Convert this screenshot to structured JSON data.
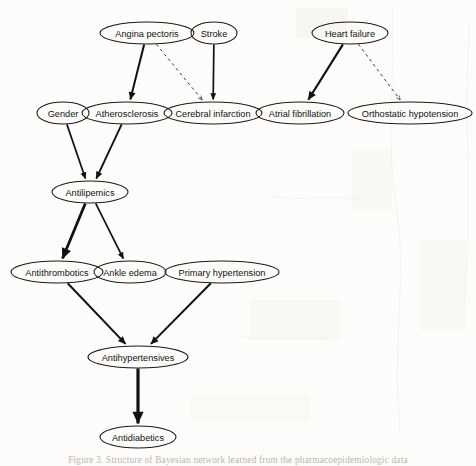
{
  "figure": {
    "type": "directed-acyclic-graph",
    "background_color": "#fdfcfa",
    "node_stroke_color": "#1a1a1a",
    "edge_solid_color": "#111111",
    "edge_dashed_color": "#3a3a3a",
    "caption": "Figure 3. Structure of Bayesian network learned from the pharmacoepidemiologic data"
  },
  "graph": {
    "nodes": [
      {
        "id": "angina_pectoris",
        "label": "Angina pectoris",
        "cx": 147,
        "cy": 33,
        "rx": 47,
        "ry": 11,
        "row": 1
      },
      {
        "id": "stroke",
        "label": "Stroke",
        "cx": 214,
        "cy": 33,
        "rx": 23,
        "ry": 11,
        "row": 1
      },
      {
        "id": "heart_failure",
        "label": "Heart failure",
        "cx": 350,
        "cy": 33,
        "rx": 38,
        "ry": 11,
        "row": 1
      },
      {
        "id": "gender",
        "label": "Gender",
        "cx": 63,
        "cy": 113,
        "rx": 26,
        "ry": 11,
        "row": 2
      },
      {
        "id": "atherosclerosis",
        "label": "Atherosclerosis",
        "cx": 127,
        "cy": 113,
        "rx": 45,
        "ry": 11,
        "row": 2
      },
      {
        "id": "cerebral_infarction",
        "label": "Cerebral infarction",
        "cx": 213,
        "cy": 113,
        "rx": 49,
        "ry": 11,
        "row": 2
      },
      {
        "id": "atrial_fibrillation",
        "label": "Atrial fibrillation",
        "cx": 300,
        "cy": 113,
        "rx": 44,
        "ry": 11,
        "row": 2
      },
      {
        "id": "orthostatic_hypotension",
        "label": "Orthostatic hypotension",
        "cx": 410,
        "cy": 113,
        "rx": 62,
        "ry": 11,
        "row": 2
      },
      {
        "id": "antilipemics",
        "label": "Antilipemics",
        "cx": 90,
        "cy": 192,
        "rx": 38,
        "ry": 11,
        "row": 3
      },
      {
        "id": "antithrombotics",
        "label": "Antithrombotics",
        "cx": 57,
        "cy": 272,
        "rx": 46,
        "ry": 11,
        "row": 4
      },
      {
        "id": "ankle_edema",
        "label": "Ankle edema",
        "cx": 130,
        "cy": 272,
        "rx": 36,
        "ry": 11,
        "row": 4
      },
      {
        "id": "primary_hypertension",
        "label": "Primary hypertension",
        "cx": 222,
        "cy": 272,
        "rx": 57,
        "ry": 11,
        "row": 4
      },
      {
        "id": "antihypertensives",
        "label": "Antihypertensives",
        "cx": 138,
        "cy": 357,
        "rx": 50,
        "ry": 11,
        "row": 5
      },
      {
        "id": "antidiabetics",
        "label": "Antidiabetics",
        "cx": 138,
        "cy": 437,
        "rx": 38,
        "ry": 11,
        "row": 6
      }
    ],
    "edges": [
      {
        "id": "e1",
        "from": "angina_pectoris",
        "to": "atherosclerosis",
        "style": "solid",
        "width": 2.0
      },
      {
        "id": "e2",
        "from": "angina_pectoris",
        "to": "cerebral_infarction",
        "style": "dashed",
        "width": 1.0
      },
      {
        "id": "e3",
        "from": "stroke",
        "to": "cerebral_infarction",
        "style": "solid",
        "width": 1.7
      },
      {
        "id": "e4",
        "from": "heart_failure",
        "to": "atrial_fibrillation",
        "style": "solid",
        "width": 2.2
      },
      {
        "id": "e5",
        "from": "heart_failure",
        "to": "orthostatic_hypotension",
        "style": "dashed",
        "width": 1.0
      },
      {
        "id": "e6",
        "from": "gender",
        "to": "antilipemics",
        "style": "solid",
        "width": 1.7
      },
      {
        "id": "e7",
        "from": "atherosclerosis",
        "to": "antilipemics",
        "style": "solid",
        "width": 1.9
      },
      {
        "id": "e8",
        "from": "antilipemics",
        "to": "antithrombotics",
        "style": "solid",
        "width": 2.8
      },
      {
        "id": "e9",
        "from": "antilipemics",
        "to": "ankle_edema",
        "style": "solid",
        "width": 1.7
      },
      {
        "id": "e10",
        "from": "antithrombotics",
        "to": "antihypertensives",
        "style": "solid",
        "width": 2.0
      },
      {
        "id": "e11",
        "from": "primary_hypertension",
        "to": "antihypertensives",
        "style": "solid",
        "width": 2.0
      },
      {
        "id": "e12",
        "from": "antihypertensives",
        "to": "antidiabetics",
        "style": "solid",
        "width": 3.2
      }
    ]
  }
}
